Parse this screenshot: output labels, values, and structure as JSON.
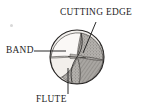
{
  "figure": {
    "name": "drill-point-end-view",
    "background_color": "#ffffff",
    "ink_color": "#1d1d1d",
    "labels": {
      "cutting_edge": "CUTTING EDGE",
      "band": "BAND",
      "flute": "FLUTE"
    },
    "leader_lines": [
      {
        "name": "cutting-edge-leader",
        "from_label": "CUTTING EDGE",
        "x1": 96,
        "y1": 22,
        "x2": 83,
        "y2": 52
      },
      {
        "name": "band-leader",
        "from_label": "BAND",
        "x1": 34,
        "y1": 51,
        "x2": 66,
        "y2": 51
      },
      {
        "name": "flute-leader",
        "from_label": "FLUTE",
        "x1": 68,
        "y1": 94,
        "x2": 68,
        "y2": 68
      }
    ],
    "geometry": {
      "circle_center_x": 77,
      "circle_center_y": 57,
      "circle_radius": 27,
      "outline_color": "#2b2b2b",
      "flute_fill": "#9a9a9a",
      "land_fill": "#f3f1ee",
      "web_fill": "#b9b6b2"
    }
  }
}
